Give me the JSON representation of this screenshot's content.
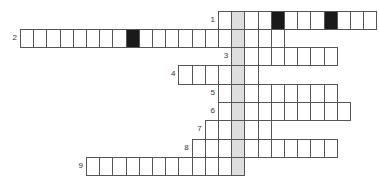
{
  "puzzle": {
    "type": "crossword",
    "cell_width": 13.2,
    "row_height": 18.3,
    "origin_x": 20,
    "origin_y": 10.5,
    "highlight_column": 16,
    "colors": {
      "border": "#555555",
      "black": "#1a1a1a",
      "shade": "#dedede"
    },
    "rows": [
      {
        "number": "1",
        "start_col": 15,
        "length": 12,
        "black": [
          19,
          23
        ]
      },
      {
        "number": "2",
        "start_col": 0,
        "length": 20,
        "black": [
          8
        ]
      },
      {
        "number": "3",
        "start_col": 16,
        "length": 8,
        "black": []
      },
      {
        "number": "4",
        "start_col": 12,
        "length": 6,
        "black": []
      },
      {
        "number": "5",
        "start_col": 15,
        "length": 9,
        "black": []
      },
      {
        "number": "6",
        "start_col": 15,
        "length": 10,
        "black": []
      },
      {
        "number": "7",
        "start_col": 14,
        "length": 5,
        "black": []
      },
      {
        "number": "8",
        "start_col": 13,
        "length": 11,
        "black": []
      },
      {
        "number": "9",
        "start_col": 5,
        "length": 12,
        "black": []
      }
    ]
  }
}
